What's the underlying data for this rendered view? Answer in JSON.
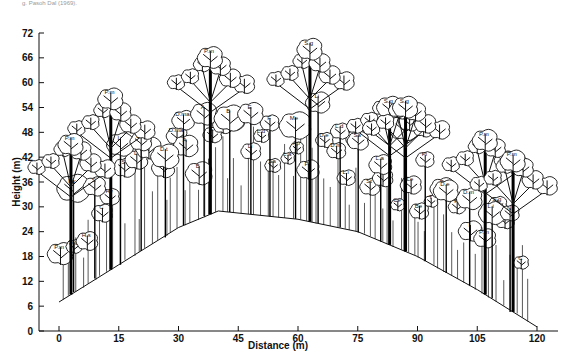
{
  "caption": "g. Pasoh Dal (1969).",
  "chart_data": {
    "type": "diagram",
    "xlabel": "Distance (m)",
    "ylabel": "Height (m)",
    "x_ticks": [
      "0",
      "15",
      "30",
      "45",
      "60",
      "75",
      "90",
      "105",
      "120"
    ],
    "y_ticks": [
      "0",
      "6",
      "12",
      "18",
      "24",
      "30",
      "36",
      "42",
      "48",
      "54",
      "60",
      "66",
      "72"
    ],
    "xlim": [
      0,
      120
    ],
    "ylim": [
      0,
      72
    ],
    "ground_profile": [
      {
        "x": 0,
        "y": 7
      },
      {
        "x": 15,
        "y": 16
      },
      {
        "x": 30,
        "y": 25
      },
      {
        "x": 40,
        "y": 29
      },
      {
        "x": 60,
        "y": 27
      },
      {
        "x": 75,
        "y": 24
      },
      {
        "x": 90,
        "y": 18
      },
      {
        "x": 105,
        "y": 10
      },
      {
        "x": 120,
        "y": 1
      }
    ],
    "emergent_trees": [
      {
        "label": "P.m",
        "x": 38,
        "height": 68
      },
      {
        "label": "S.g",
        "x": 63,
        "height": 70
      },
      {
        "label": "P.m",
        "x": 13,
        "height": 58
      },
      {
        "label": "P.m",
        "x": 3,
        "height": 47
      },
      {
        "label": "S.g",
        "x": 83,
        "height": 56
      },
      {
        "label": "S.g",
        "x": 87,
        "height": 56
      },
      {
        "label": "P.m",
        "x": 107,
        "height": 48
      },
      {
        "label": "P.m",
        "x": 114,
        "height": 43
      }
    ],
    "species_labels": [
      "P.m",
      "S.g",
      "H.s",
      "C",
      "Hy",
      "S",
      "L",
      "D.f",
      "D.t",
      "D.ma",
      "A",
      "B",
      "E",
      "F",
      "Me",
      "Li",
      "L.d",
      "Sa",
      "L.a",
      "Ap",
      "Pi",
      "D.e",
      "D.m",
      "L.i",
      "N",
      "St",
      "Di",
      "Ce",
      "Le",
      "Be",
      "T",
      "P",
      "R",
      "I"
    ]
  },
  "axes": {
    "y_title": "Height (m)",
    "x_title": "Distance (m)"
  }
}
